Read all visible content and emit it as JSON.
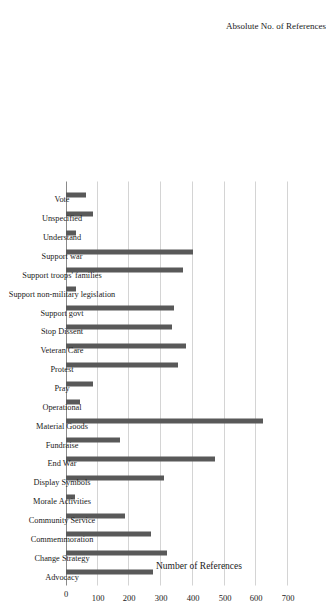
{
  "chart_data": {
    "type": "bar",
    "title": "",
    "xlabel": "Absolute No. of References",
    "ylabel": "Number of References",
    "ylim": [
      0,
      700
    ],
    "yticks": [
      0,
      100,
      200,
      300,
      400,
      500,
      600,
      700
    ],
    "grid": true,
    "legend": null,
    "orientation": "vertical-bars-rotated-90",
    "bar_color": "#595959",
    "categories": [
      "Vote",
      "Unspecified",
      "Understand",
      "Support war",
      "Support troops' families",
      "Support non-military legislation",
      "Support govt",
      "Stop Dissent",
      "Veteran Care",
      "Protest",
      "Pray",
      "Operational",
      "Material Goods",
      "Fundraise",
      "End War",
      "Display Symbols",
      "Morale Activities",
      "Community Service",
      "Commemmoration",
      "Change Strategy",
      "Advocacy"
    ],
    "values": [
      63,
      85,
      31,
      400,
      370,
      32,
      340,
      333,
      378,
      352,
      86,
      44,
      620,
      170,
      470,
      308,
      30,
      185,
      268,
      318,
      275
    ]
  },
  "axes": {
    "y_title": "Number of References",
    "x_title": "Absolute No. of References",
    "y_tick_labels": [
      "0",
      "100",
      "200",
      "300",
      "400",
      "500",
      "600",
      "700"
    ]
  }
}
